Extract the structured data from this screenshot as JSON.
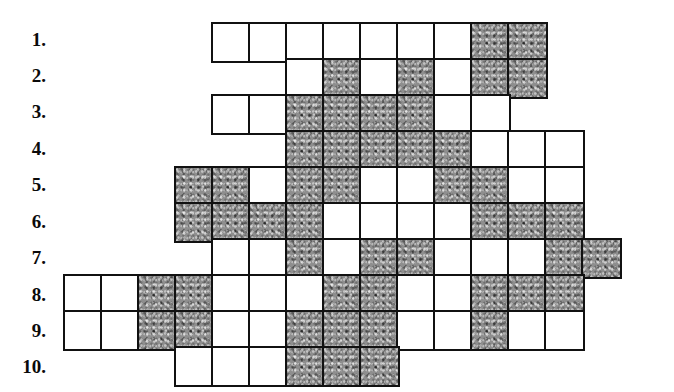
{
  "colors": {
    "background": "#ffffff",
    "cell_border": "#111111",
    "cell_white": "#ffffff",
    "cell_shaded": "#8e8e8e",
    "label_text": "#0a0a0a"
  },
  "grid": {
    "cell_size": 41,
    "border_width": 2.2,
    "origin_x": 63,
    "origin_y": 22,
    "columns": 15,
    "rows": 10,
    "shaded_legend": "shaded cell",
    "white_legend": "empty cell"
  },
  "rows": [
    {
      "label": "1.",
      "label_y": 30,
      "start_col": 4,
      "cells": [
        "white",
        "white",
        "white",
        "white",
        "white",
        "white",
        "white",
        "shaded",
        "shaded"
      ]
    },
    {
      "label": "2.",
      "label_y": 66,
      "start_col": 6,
      "cells": [
        "white",
        "shaded",
        "white",
        "shaded",
        "white",
        "shaded",
        "shaded"
      ]
    },
    {
      "label": "3.",
      "label_y": 102,
      "start_col": 4,
      "cells": [
        "white",
        "white",
        "shaded",
        "shaded",
        "shaded",
        "shaded",
        "white",
        "white"
      ]
    },
    {
      "label": "4.",
      "label_y": 139,
      "start_col": 6,
      "cells": [
        "shaded",
        "shaded",
        "shaded",
        "shaded",
        "shaded",
        "white",
        "white",
        "white"
      ]
    },
    {
      "label": "5.",
      "label_y": 175,
      "start_col": 3,
      "cells": [
        "shaded",
        "shaded",
        "white",
        "shaded",
        "shaded",
        "white",
        "white",
        "shaded",
        "shaded",
        "white",
        "white"
      ]
    },
    {
      "label": "6.",
      "label_y": 212,
      "start_col": 3,
      "cells": [
        "shaded",
        "shaded",
        "shaded",
        "shaded",
        "white",
        "white",
        "white",
        "white",
        "shaded",
        "shaded",
        "shaded"
      ]
    },
    {
      "label": "7.",
      "label_y": 248,
      "start_col": 4,
      "cells": [
        "white",
        "white",
        "shaded",
        "white",
        "shaded",
        "shaded",
        "white",
        "white",
        "white",
        "shaded",
        "shaded"
      ]
    },
    {
      "label": "8.",
      "label_y": 285,
      "start_col": 0,
      "cells": [
        "white",
        "white",
        "shaded",
        "shaded",
        "white",
        "white",
        "white",
        "shaded",
        "shaded",
        "white",
        "white",
        "shaded",
        "shaded",
        "shaded"
      ]
    },
    {
      "label": "9.",
      "label_y": 321,
      "start_col": 0,
      "cells": [
        "white",
        "white",
        "shaded",
        "shaded",
        "white",
        "white",
        "shaded",
        "shaded",
        "shaded",
        "white",
        "white",
        "shaded",
        "white",
        "white"
      ]
    },
    {
      "label": "10.",
      "label_y": 357,
      "start_col": 3,
      "cells": [
        "white",
        "white",
        "white",
        "shaded",
        "shaded",
        "shaded"
      ]
    }
  ]
}
